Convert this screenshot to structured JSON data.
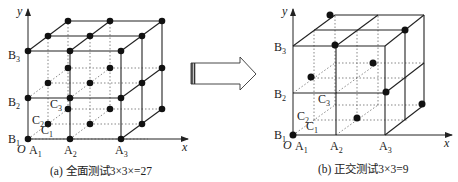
{
  "panels": [
    {
      "id": "a",
      "caption": "(a) 全面测试3×3×=27",
      "axes": {
        "x": "x",
        "y": "y",
        "origin": "O"
      },
      "labels": {
        "A": [
          "A",
          "A",
          "A"
        ],
        "A_sub": [
          "1",
          "2",
          "3"
        ],
        "B": [
          "B",
          "B",
          "B"
        ],
        "B_sub": [
          "1",
          "2",
          "3"
        ],
        "C": [
          "C",
          "C",
          "C"
        ],
        "C_sub": [
          "1",
          "2",
          "3"
        ]
      },
      "points_count": 27
    },
    {
      "id": "b",
      "caption": "(b) 正交测试3×3=9",
      "axes": {
        "x": "x",
        "y": "y",
        "origin": "O"
      },
      "labels": {
        "A": [
          "A",
          "A",
          "A"
        ],
        "A_sub": [
          "1",
          "2",
          "3"
        ],
        "B": [
          "B",
          "B",
          "B"
        ],
        "B_sub": [
          "1",
          "2",
          "3"
        ],
        "C": [
          "C",
          "C",
          "C"
        ],
        "C_sub": [
          "1",
          "2",
          "3"
        ]
      },
      "points_count": 9,
      "selected_points": [
        [
          1,
          1,
          1
        ],
        [
          2,
          1,
          2
        ],
        [
          3,
          1,
          3
        ],
        [
          1,
          2,
          3
        ],
        [
          2,
          2,
          1
        ],
        [
          3,
          2,
          2
        ],
        [
          1,
          3,
          2
        ],
        [
          2,
          3,
          3
        ],
        [
          3,
          3,
          1
        ]
      ]
    }
  ],
  "arrow": {
    "direction": "right",
    "meaning": "full-test-to-orthogonal-test"
  }
}
